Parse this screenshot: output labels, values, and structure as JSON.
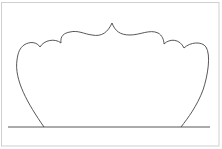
{
  "figure": {
    "stroke_color": "#444444",
    "frame_color": "#cccccc",
    "background": "#ffffff"
  }
}
